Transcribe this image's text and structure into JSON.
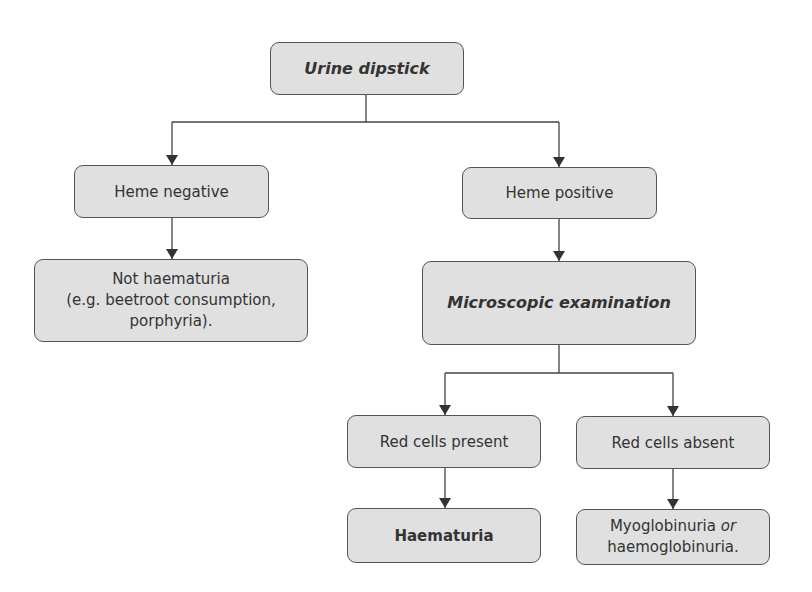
{
  "diagram": {
    "type": "flowchart",
    "colors": {
      "node_fill": "#e0e0e0",
      "node_border": "#555555",
      "line": "#444444",
      "text": "#333333"
    },
    "nodes": {
      "urine_dipstick": {
        "label": "Urine dipstick",
        "style": "bold-italic"
      },
      "heme_negative": {
        "label": "Heme negative"
      },
      "heme_positive": {
        "label": "Heme positive"
      },
      "not_haematuria": {
        "line1": "Not haematuria",
        "line2": "(e.g. beetroot consumption,",
        "line3": "porphyria)."
      },
      "microscopic_examination": {
        "label": "Microscopic examination",
        "style": "bold-italic"
      },
      "red_cells_present": {
        "label": "Red cells present"
      },
      "red_cells_absent": {
        "label": "Red cells absent"
      },
      "haematuria": {
        "label": "Haematuria",
        "style": "bold"
      },
      "myoglobinuria": {
        "line1a": "Myoglobinuria ",
        "line1b": "or",
        "line2": "haemoglobinuria."
      }
    },
    "edges": [
      [
        "urine_dipstick",
        "heme_negative"
      ],
      [
        "urine_dipstick",
        "heme_positive"
      ],
      [
        "heme_negative",
        "not_haematuria"
      ],
      [
        "heme_positive",
        "microscopic_examination"
      ],
      [
        "microscopic_examination",
        "red_cells_present"
      ],
      [
        "microscopic_examination",
        "red_cells_absent"
      ],
      [
        "red_cells_present",
        "haematuria"
      ],
      [
        "red_cells_absent",
        "myoglobinuria"
      ]
    ]
  }
}
